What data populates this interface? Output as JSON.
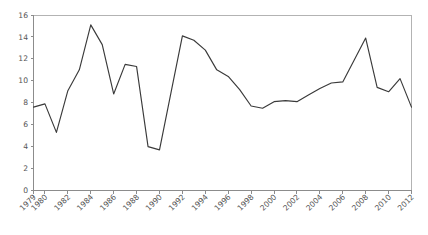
{
  "chart_data": {
    "type": "line",
    "title": "",
    "subtitle": "",
    "xlabel": "",
    "ylabel": "",
    "xlim": [
      1979,
      2012
    ],
    "ylim": [
      0,
      16
    ],
    "grid": false,
    "legend": "none",
    "yticks": [
      0,
      2,
      4,
      6,
      8,
      10,
      12,
      14,
      16
    ],
    "ytick_labels": [
      "0",
      "2",
      "4",
      "6",
      "8",
      "10",
      "12",
      "14",
      "16"
    ],
    "xticks": [
      1979,
      1980,
      1982,
      1984,
      1986,
      1988,
      1990,
      1992,
      1994,
      1996,
      1998,
      2000,
      2002,
      2004,
      2006,
      2008,
      2010,
      2012
    ],
    "xtick_labels": [
      "1979",
      "1980",
      "1982",
      "1984",
      "1986",
      "1988",
      "1990",
      "1992",
      "1994",
      "1996",
      "1998",
      "2000",
      "2002",
      "2004",
      "2006",
      "2008",
      "2010",
      "2012"
    ],
    "series": [
      {
        "name": "series-1",
        "color": "#3a3a3a",
        "x": [
          1979,
          1980,
          1981,
          1982,
          1983,
          1984,
          1985,
          1986,
          1987,
          1988,
          1989,
          1990,
          1991,
          1992,
          1993,
          1994,
          1995,
          1996,
          1997,
          1998,
          1999,
          2000,
          2001,
          2002,
          2003,
          2004,
          2005,
          2006,
          2007,
          2008,
          2009,
          2010,
          2011,
          2012
        ],
        "values": [
          7.6,
          7.9,
          5.3,
          9.1,
          11.0,
          15.1,
          13.3,
          8.8,
          11.5,
          11.3,
          4.0,
          3.7,
          8.9,
          14.1,
          13.7,
          12.8,
          11.0,
          10.4,
          9.2,
          7.7,
          7.5,
          8.1,
          8.2,
          8.1,
          8.7,
          9.3,
          9.8,
          9.9,
          11.9,
          13.9,
          9.4,
          9.0,
          10.2,
          7.6
        ]
      }
    ]
  },
  "axes": {
    "x_axis_name": "year-axis",
    "y_axis_name": "value-axis"
  }
}
